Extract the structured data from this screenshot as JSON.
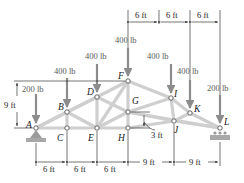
{
  "figure": {
    "type": "truss",
    "nodes": {
      "A": {
        "label": "A",
        "x": 36,
        "y": 128
      },
      "B": {
        "label": "B",
        "x": 67,
        "y": 112
      },
      "C": {
        "label": "C",
        "x": 67,
        "y": 128
      },
      "D": {
        "label": "D",
        "x": 97,
        "y": 97
      },
      "E": {
        "label": "E",
        "x": 97,
        "y": 128
      },
      "F": {
        "label": "F",
        "x": 128,
        "y": 81
      },
      "G": {
        "label": "G",
        "x": 128,
        "y": 112
      },
      "H": {
        "label": "H",
        "x": 128,
        "y": 128
      },
      "I": {
        "label": "I",
        "x": 171,
        "y": 98
      },
      "J": {
        "label": "J",
        "x": 174,
        "y": 121
      },
      "K": {
        "label": "K",
        "x": 190,
        "y": 113
      },
      "L": {
        "label": "L",
        "x": 220,
        "y": 128
      }
    },
    "loads": [
      {
        "node": "A",
        "label": "200 lb"
      },
      {
        "node": "B",
        "label": "400 lb"
      },
      {
        "node": "D",
        "label": "400 lb"
      },
      {
        "node": "F",
        "label": "400 lb"
      },
      {
        "node": "I",
        "label": "400 lb"
      },
      {
        "node": "K",
        "label": "400 lb"
      },
      {
        "node": "L",
        "label": "200 lb"
      }
    ],
    "dimensions": {
      "height_left": "9 ft",
      "offset_G_H": "3 ft",
      "bottom": [
        "6 ft",
        "6 ft",
        "6 ft",
        "9 ft",
        "9 ft"
      ],
      "top": [
        "6 ft",
        "6 ft",
        "6 ft"
      ]
    },
    "colors": {
      "member": "#d9d9d9",
      "member_edge": "#b5b5b5",
      "arrow": "#8c8c8c",
      "line": "#1a1a1a",
      "support": "#9a9a9a"
    }
  }
}
